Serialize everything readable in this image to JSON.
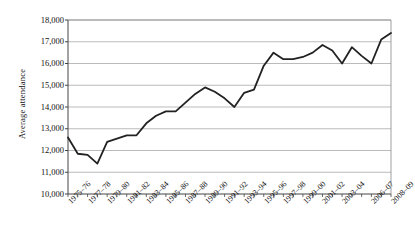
{
  "chart_data": {
    "type": "line",
    "title": "",
    "xlabel": "",
    "ylabel": "Average attendance",
    "ylim": [
      10000,
      18000
    ],
    "ytick_values": [
      10000,
      11000,
      12000,
      13000,
      14000,
      15000,
      16000,
      17000,
      18000
    ],
    "ytick_labels": [
      "10,000",
      "11,000",
      "12,000",
      "13,000",
      "14,000",
      "15,000",
      "16,000",
      "17,000",
      "18,000"
    ],
    "grid": true,
    "legend": null,
    "legend_position": "none",
    "line_color": "#222222",
    "grid_color": "#aaaaaa",
    "axis_color": "#555555",
    "categories": [
      "1975-76",
      "1976-77",
      "1977-78",
      "1978-79",
      "1979-80",
      "1980-81",
      "1981-82",
      "1982-83",
      "1983-84",
      "1984-85",
      "1985-86",
      "1986-87",
      "1987-88",
      "1988-89",
      "1989-90",
      "1990-91",
      "1991-92",
      "1992-93",
      "1993-94",
      "1994-95",
      "1995-96",
      "1996-97",
      "1997-98",
      "1998-99",
      "1999-00",
      "2000-01",
      "2001-02",
      "2002-03",
      "2003-04",
      "2004-05",
      "2005-06",
      "2006-07",
      "2007-08",
      "2008-09"
    ],
    "xtick_labels_shown": [
      "1975-76",
      "1977-78",
      "1979-80",
      "1981-82",
      "1983-84",
      "1985-86",
      "1987-88",
      "1989-90",
      "1991-92",
      "1993-94",
      "1995-96",
      "1997-98",
      "1999-00",
      "2001-02",
      "2003-04",
      "2006-07",
      "2008-09"
    ],
    "values": [
      12600,
      11850,
      11800,
      11400,
      12400,
      12550,
      12700,
      12700,
      13250,
      13600,
      13800,
      13800,
      14200,
      14600,
      14900,
      14700,
      14400,
      14000,
      14650,
      14800,
      15900,
      16500,
      16200,
      16200,
      16300,
      16500,
      16850,
      16600,
      16000,
      16750,
      16350,
      16000,
      17100,
      17400
    ]
  }
}
